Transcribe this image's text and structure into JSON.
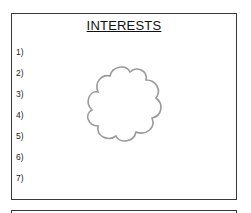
{
  "worksheet": {
    "title": "INTERESTS",
    "items": [
      {
        "label": "1)"
      },
      {
        "label": "2)"
      },
      {
        "label": "3)"
      },
      {
        "label": "4)"
      },
      {
        "label": "5)"
      },
      {
        "label": "6)"
      },
      {
        "label": "7)"
      }
    ],
    "cloud_icon": "cloud-icon",
    "colors": {
      "border": "#3a3a3a",
      "cloud_stroke": "#9a9a9a",
      "text": "#222222"
    }
  }
}
